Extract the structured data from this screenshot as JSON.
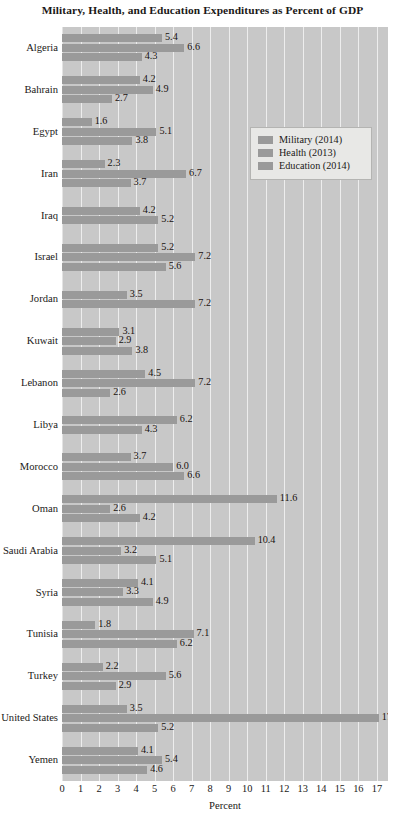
{
  "chart_data": {
    "type": "bar",
    "orientation": "horizontal",
    "title": "Military, Health, and Education Expenditures as Percent of GDP",
    "xlabel": "Percent",
    "ylabel": "",
    "xlim": [
      0,
      17.6
    ],
    "xticks": [
      0,
      1,
      2,
      3,
      4,
      5,
      6,
      7,
      8,
      9,
      10,
      11,
      12,
      13,
      14,
      15,
      16,
      17
    ],
    "grid": true,
    "legend_position": "upper-right-inside",
    "legend": [
      "Military (2014)",
      "Health (2013)",
      "Education (2014)"
    ],
    "categories": [
      "Algeria",
      "Bahrain",
      "Egypt",
      "Iran",
      "Iraq",
      "Israel",
      "Jordan",
      "Kuwait",
      "Lebanon",
      "Libya",
      "Morocco",
      "Oman",
      "Saudi Arabia",
      "Syria",
      "Tunisia",
      "Turkey",
      "United States",
      "Yemen"
    ],
    "series": [
      {
        "name": "Military (2014)",
        "color": "#9a9a9a",
        "values": [
          5.4,
          4.2,
          1.6,
          2.3,
          4.2,
          5.2,
          3.5,
          3.1,
          4.5,
          null,
          3.7,
          11.6,
          10.4,
          4.1,
          1.8,
          2.2,
          3.5,
          4.1
        ]
      },
      {
        "name": "Health (2013)",
        "color": "#9a9a9a",
        "values": [
          6.6,
          4.9,
          5.1,
          6.7,
          5.2,
          7.2,
          7.2,
          2.9,
          7.2,
          6.2,
          6.0,
          2.6,
          3.2,
          3.3,
          7.1,
          5.6,
          17.1,
          5.4
        ]
      },
      {
        "name": "Education (2014)",
        "color": "#9a9a9a",
        "values": [
          4.3,
          2.7,
          3.8,
          3.7,
          null,
          5.6,
          null,
          3.8,
          2.6,
          4.3,
          6.6,
          4.2,
          5.1,
          4.9,
          6.2,
          2.9,
          5.2,
          4.6
        ]
      }
    ],
    "value_labels": {
      "Algeria": [
        "5.4",
        "6.6",
        "4.3"
      ],
      "Bahrain": [
        "4.2",
        "4.9",
        "2.7"
      ],
      "Egypt": [
        "1.6",
        "5.1",
        "3.8"
      ],
      "Iran": [
        "2.3",
        "6.7",
        "3.7"
      ],
      "Iraq": [
        "4.2",
        "5.2"
      ],
      "Israel": [
        "5.2",
        "7.2",
        "5.6"
      ],
      "Jordan": [
        "3.5",
        "7.2"
      ],
      "Kuwait": [
        "3.1",
        "2.9",
        "3.8"
      ],
      "Lebanon": [
        "4.5",
        "7.2",
        "2.6"
      ],
      "Libya": [
        "6.2",
        "4.3"
      ],
      "Morocco": [
        "3.7",
        "6.0",
        "6.6"
      ],
      "Oman": [
        "11.6",
        "2.6",
        "4.2"
      ],
      "Saudi Arabia": [
        "10.4",
        "3.2",
        "5.1"
      ],
      "Syria": [
        "4.1",
        "3.3",
        "4.9"
      ],
      "Tunisia": [
        "1.8",
        "7.1",
        "6.2"
      ],
      "Turkey": [
        "2.2",
        "5.6",
        "2.9"
      ],
      "United States": [
        "3.5",
        "17.1",
        "5.2"
      ],
      "Yemen": [
        "4.1",
        "5.4",
        "4.6"
      ]
    }
  },
  "style": {
    "plot_background": "#c8c8c8",
    "bar_color": "#9a9a9a",
    "gridline_color": "#ededed",
    "text_color": "#1b1917",
    "legend_background": "#e8e8e6",
    "legend_border": "#b4b4b2"
  }
}
